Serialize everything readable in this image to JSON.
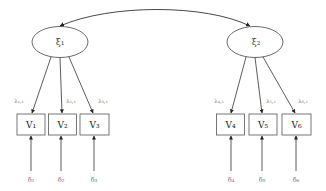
{
  "diagram": {
    "type": "structural-equation-model",
    "colors": {
      "stroke": "#333333",
      "box_stroke": "#555555",
      "text": "#444444"
    },
    "covariance": {
      "from": "ksi1",
      "to": "ksi2",
      "bidirectional": true
    },
    "latents": [
      {
        "id": "ksi1",
        "label": "ξ₁",
        "cx": 60,
        "cy": 42
      },
      {
        "id": "ksi2",
        "label": "ξ₂",
        "cx": 255,
        "cy": 42
      }
    ],
    "observed": [
      {
        "id": "v1",
        "label": "V₁",
        "x": 17,
        "factor": "ksi1",
        "loading": "λ₁,₁",
        "error": "δ₁"
      },
      {
        "id": "v2",
        "label": "V₂",
        "x": 48,
        "factor": "ksi1",
        "loading": "λ₂,₁",
        "error": "δ₂"
      },
      {
        "id": "v3",
        "label": "V₃",
        "x": 80,
        "factor": "ksi1",
        "loading": "λ₃,₁",
        "error": "δ₃"
      },
      {
        "id": "v4",
        "label": "V₄",
        "x": 216,
        "factor": "ksi2",
        "loading": "λ₄,₂",
        "error": "δ₄"
      },
      {
        "id": "v5",
        "label": "V₅",
        "x": 249,
        "factor": "ksi2",
        "loading": "λ₅,₂",
        "error": "δ₅"
      },
      {
        "id": "v6",
        "label": "V₆",
        "x": 282,
        "factor": "ksi2",
        "loading": "λ₆,₂",
        "error": "δ₆"
      }
    ]
  }
}
